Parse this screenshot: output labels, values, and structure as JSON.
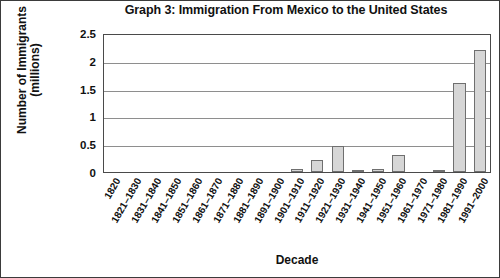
{
  "chart_data": {
    "type": "bar",
    "title": "Graph 3: Immigration From Mexico to the United States",
    "xlabel": "Decade",
    "ylabel_line1": "Number of Immigrants",
    "ylabel_line2": "(millions)",
    "ylim": [
      0,
      2.5
    ],
    "yticks": [
      "0",
      "0.5",
      "1",
      "1.5",
      "2",
      "2.5"
    ],
    "ytick_values": [
      0,
      0.5,
      1,
      1.5,
      2,
      2.5
    ],
    "grid": true,
    "legend": "none",
    "bar_fill": "#d6d6d6",
    "bar_edge": "#6f6f6f",
    "categories": [
      "1820",
      "1821–1830",
      "1831–1840",
      "1841–1850",
      "1851–1860",
      "1861–1870",
      "1871–1880",
      "1881–1890",
      "1891–1900",
      "1901–1910",
      "1911–1920",
      "1921–1930",
      "1931–1940",
      "1941–1950",
      "1951–1960",
      "1961–1970",
      "1971–1980",
      "1981–1990",
      "1991–2000"
    ],
    "values": [
      0,
      0,
      0,
      0,
      0,
      0,
      0,
      0,
      0,
      0.05,
      0.22,
      0.46,
      0.02,
      0.06,
      0.3,
      0,
      0.01,
      1.6,
      2.2
    ]
  }
}
